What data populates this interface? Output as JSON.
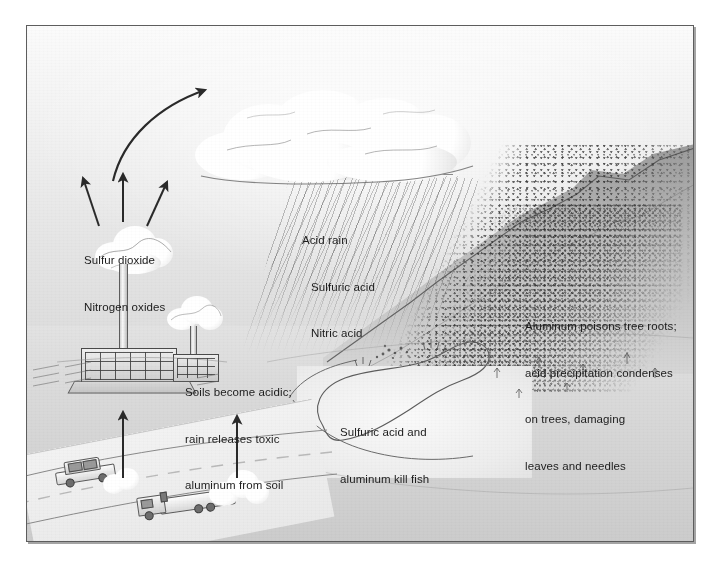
{
  "illustration": {
    "title": "Acid rain formation and effects diagram",
    "frame_color": "#5d5d5d",
    "background_color": "#e7e7e7",
    "text_color": "#1d1d1d"
  },
  "labels": {
    "emissions": {
      "line1": "Sulfur dioxide",
      "line2": "Nitrogen oxides"
    },
    "acid_rain": {
      "line1": "Acid rain",
      "line2": "Sulfuric acid",
      "line3": "Nitric acid"
    },
    "soils": {
      "line1": "Soils become acidic;",
      "line2": "rain releases toxic",
      "line3": "aluminum from soil"
    },
    "trees": {
      "line1": "Aluminum poisons tree roots;",
      "line2": "acid precipitation condenses",
      "line3": "on trees, damaging",
      "line4": "leaves and needles"
    },
    "lake": {
      "line1": "Sulfuric acid and",
      "line2": "aluminum kill fish"
    }
  },
  "scene_elements": {
    "cloud": "rain-cloud",
    "rain": "acid-rain-streaks",
    "smokestack": "power-plant-smokestack",
    "plant": "power-plant-building",
    "ridge": "forested-mountain-ridge",
    "lake": "acidified-lake",
    "car": "passenger-car",
    "truck": "cargo-truck",
    "road": "highway",
    "curved_arrow": "pollutant-transport-arrow",
    "emission_arrows": "smokestack-emission-arrows",
    "vehicle_arrows": "vehicle-exhaust-arrows"
  }
}
